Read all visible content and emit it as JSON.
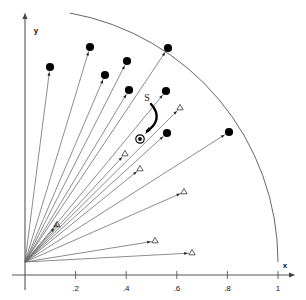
{
  "figure": {
    "title": "",
    "background_color": "#ffffff",
    "line_color": "#555555",
    "marker_color": "#000000",
    "axis_color": "#555555"
  },
  "axes": {
    "x": {
      "label": "x",
      "label_name": "x-axis-label",
      "ticks": [
        {
          "value": 0.2,
          "label": ".2"
        },
        {
          "value": 0.4,
          "label": ".4"
        },
        {
          "value": 0.6,
          "label": ".6"
        },
        {
          "value": 0.8,
          "label": ".8"
        },
        {
          "value": 1.0,
          "label": "1"
        }
      ],
      "range": [
        0,
        1.08
      ]
    },
    "y": {
      "label": "y",
      "label_name": "y-axis-label",
      "ticks": [],
      "range": [
        0,
        1.08
      ]
    }
  },
  "annotations": [
    {
      "name": "s-label",
      "text": "S",
      "px": 147,
      "py": 101
    },
    {
      "name": "a-label",
      "text": "A",
      "px": 56,
      "py": 227
    }
  ],
  "arc": {
    "name": "unit-arc",
    "radius": 1.0,
    "description": "quarter circle of radius 1 centered at origin"
  },
  "origin_marker": {
    "name": "circled-dot-marker",
    "px": 140,
    "py": 139,
    "symbol": "circled-dot"
  },
  "chart_data": {
    "type": "scatter",
    "title": "",
    "xlabel": "x",
    "ylabel": "y",
    "xlim": [
      0,
      1.08
    ],
    "ylim": [
      0,
      1.08
    ],
    "grid": false,
    "legend": null,
    "origin_px": [
      25,
      262
    ],
    "scale_px_per_unit": 253,
    "series": [
      {
        "name": "large-dot-rays",
        "marker": "filled-circle",
        "points": [
          {
            "x": 0.1,
            "y": 0.77,
            "px": 50,
            "py": 67
          },
          {
            "x": 0.258,
            "y": 0.91,
            "px": 90,
            "py": 47
          },
          {
            "x": 0.318,
            "y": 0.818,
            "px": 105,
            "py": 75
          },
          {
            "x": 0.405,
            "y": 0.845,
            "px": 127,
            "py": 61
          },
          {
            "x": 0.41,
            "y": 0.695,
            "px": 129,
            "py": 90
          },
          {
            "x": 0.565,
            "y": 0.88,
            "px": 168,
            "py": 48
          },
          {
            "x": 0.555,
            "y": 0.66,
            "px": 166,
            "py": 91
          },
          {
            "x": 0.56,
            "y": 0.528,
            "px": 167,
            "py": 133
          },
          {
            "x": 0.808,
            "y": 0.53,
            "px": 229,
            "py": 132
          }
        ]
      },
      {
        "name": "triangle-rays",
        "marker": "open-triangle",
        "points": [
          {
            "x": 0.145,
            "y": 0.155,
            "px": 57,
            "py": 225
          },
          {
            "x": 0.395,
            "y": 0.428,
            "px": 125,
            "py": 154
          },
          {
            "x": 0.455,
            "y": 0.37,
            "px": 140,
            "py": 169
          },
          {
            "x": 0.61,
            "y": 0.61,
            "px": 180,
            "py": 108
          },
          {
            "x": 0.625,
            "y": 0.278,
            "px": 184,
            "py": 192
          },
          {
            "x": 0.51,
            "y": 0.082,
            "px": 155,
            "py": 241
          },
          {
            "x": 0.66,
            "y": 0.035,
            "px": 192,
            "py": 253
          }
        ]
      }
    ]
  }
}
